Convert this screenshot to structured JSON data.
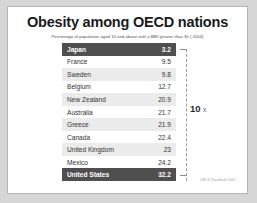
{
  "chart": {
    "title": "Obesity among OECD nations",
    "subtitle": "Percentage of population aged 15 and above with a BMI greater than 30 ( 2004)",
    "ratio_annotation": {
      "number": "10",
      "unit": "x"
    },
    "source": "OECD Factbook 2007"
  },
  "chart_data": {
    "type": "table",
    "title": "Obesity among OECD nations",
    "subtitle": "Percentage of population aged 15 and above with a BMI greater than 30 ( 2004)",
    "xlabel": "",
    "ylabel": "Percentage of population aged 15 and above with a BMI greater than 30",
    "grid": false,
    "legend_position": "none",
    "sort_order": "ascending",
    "annotations": [
      "10 x",
      "OECD Factbook 2007"
    ],
    "categories": [
      "Japan",
      "France",
      "Sweden",
      "Belgium",
      "New Zealand",
      "Australia",
      "Greece",
      "Canada",
      "United Kingdom",
      "Mexico",
      "United States"
    ],
    "values": [
      3.2,
      9.5,
      9.8,
      12.7,
      20.9,
      21.7,
      21.9,
      22.4,
      23,
      24.2,
      32.2
    ],
    "value_labels": [
      "3.2",
      "9.5",
      "9.8",
      "12.7",
      "20.9",
      "21.7",
      "21.9",
      "22.4",
      "23",
      "24.2",
      "32.2"
    ],
    "highlighted": [
      "Japan",
      "United States"
    ],
    "colors": {
      "highlight_row": "#4f4f4f",
      "stripe_row": "#ebebeb",
      "plain_row": "#ffffff",
      "text": "#333333",
      "highlight_text": "#ffffff"
    },
    "rows": [
      {
        "label": "Japan",
        "value": "3.2",
        "style": "highlight"
      },
      {
        "label": "France",
        "value": "9.5",
        "style": "plain"
      },
      {
        "label": "Sweden",
        "value": "9.8",
        "style": "stripe"
      },
      {
        "label": "Belgium",
        "value": "12.7",
        "style": "plain"
      },
      {
        "label": "New Zealand",
        "value": "20.9",
        "style": "stripe"
      },
      {
        "label": "Australia",
        "value": "21.7",
        "style": "plain"
      },
      {
        "label": "Greece",
        "value": "21.9",
        "style": "stripe"
      },
      {
        "label": "Canada",
        "value": "22.4",
        "style": "plain"
      },
      {
        "label": "United Kingdom",
        "value": "23",
        "style": "stripe"
      },
      {
        "label": "Mexico",
        "value": "24.2",
        "style": "plain"
      },
      {
        "label": "United States",
        "value": "32.2",
        "style": "highlight"
      }
    ]
  }
}
